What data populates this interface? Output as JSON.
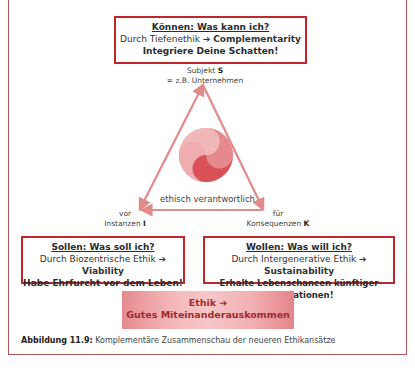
{
  "top_box": {
    "heading": "Können: Was kann ich?",
    "line2_prefix": "Durch Tiefenethik",
    "arrow": "➔",
    "line2_target": "Complementarity",
    "line3": "Integriere Deine Schatten!"
  },
  "apex_label": {
    "line1_text": "Subjekt",
    "line1_symbol": "S",
    "line2": "= z.B.  Unternehmen"
  },
  "center_label": "ethisch verantwortlich",
  "left_label": {
    "line1": "vor",
    "line2_text": "Instanzen",
    "line2_symbol": "I"
  },
  "right_label": {
    "line1": "für",
    "line2_text": "Konsequenzen",
    "line2_symbol": "K"
  },
  "left_box": {
    "heading": "Sollen: Was soll ich?",
    "line2_prefix": "Durch Biozentrische Ethik",
    "arrow": "➔",
    "line2_target": "Viability",
    "line3": "Habe Ehrfurcht vor dem Leben!"
  },
  "right_box": {
    "heading": "Wollen: Was will ich?",
    "line2_prefix": "Durch Intergenerative Ethik",
    "arrow": "➔",
    "line2_target": "Sustainability",
    "line3": "Erhalte Lebenschancen künftiger Generationen!"
  },
  "ethik_box": {
    "line1": "Ethik",
    "arrow": "➔",
    "line2": "Gutes Miteinanderauskommen"
  },
  "caption": {
    "label": "Abbildung 11.9:",
    "text": "Komplementäre Zusammenschau der neueren Ethikansätze"
  },
  "colors": {
    "box_border": "#c0272d",
    "triangle": "#e08a8c",
    "frame": "#b4565c"
  }
}
